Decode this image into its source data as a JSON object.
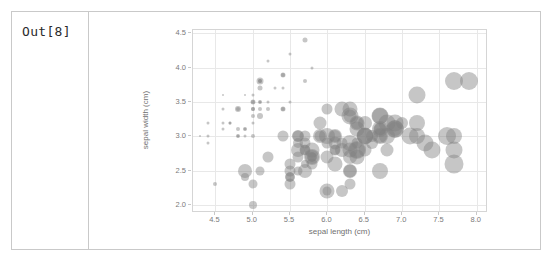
{
  "notebook": {
    "prompt_label": "Out[8]"
  },
  "chart_data": {
    "type": "scatter",
    "title": "",
    "xlabel": "sepal length (cm)",
    "ylabel": "sepal width (cm)",
    "xlim": [
      4.2,
      8.15
    ],
    "ylim": [
      1.88,
      4.55
    ],
    "xticks": [
      4.5,
      5.0,
      5.5,
      6.0,
      6.5,
      7.0,
      7.5,
      8.0
    ],
    "yticks": [
      2.0,
      2.5,
      3.0,
      3.5,
      4.0,
      4.5
    ],
    "xtick_labels": [
      "4.5",
      "5.0",
      "5.5",
      "6.0",
      "6.5",
      "7.0",
      "7.5",
      "8.0"
    ],
    "ytick_labels": [
      "2.0",
      "2.5",
      "3.0",
      "3.5",
      "4.0",
      "4.5"
    ],
    "grid": true,
    "legend": "none",
    "marker_color": "#808080",
    "marker_alpha": 0.45,
    "size_encoding": "petal size (bubble radius)",
    "points": [
      {
        "x": 5.1,
        "y": 3.5,
        "s": 3
      },
      {
        "x": 4.9,
        "y": 3.0,
        "s": 3
      },
      {
        "x": 4.7,
        "y": 3.2,
        "s": 3
      },
      {
        "x": 4.6,
        "y": 3.1,
        "s": 3
      },
      {
        "x": 5.0,
        "y": 3.6,
        "s": 3
      },
      {
        "x": 5.4,
        "y": 3.9,
        "s": 5
      },
      {
        "x": 4.6,
        "y": 3.4,
        "s": 3
      },
      {
        "x": 5.0,
        "y": 3.4,
        "s": 4
      },
      {
        "x": 4.4,
        "y": 2.9,
        "s": 3
      },
      {
        "x": 4.9,
        "y": 3.1,
        "s": 3
      },
      {
        "x": 5.4,
        "y": 3.7,
        "s": 3
      },
      {
        "x": 4.8,
        "y": 3.4,
        "s": 4
      },
      {
        "x": 4.8,
        "y": 3.0,
        "s": 3
      },
      {
        "x": 4.3,
        "y": 3.0,
        "s": 2
      },
      {
        "x": 5.8,
        "y": 4.0,
        "s": 3
      },
      {
        "x": 5.7,
        "y": 4.4,
        "s": 5
      },
      {
        "x": 5.4,
        "y": 3.9,
        "s": 4
      },
      {
        "x": 5.1,
        "y": 3.5,
        "s": 4
      },
      {
        "x": 5.7,
        "y": 3.8,
        "s": 4
      },
      {
        "x": 5.1,
        "y": 3.8,
        "s": 4
      },
      {
        "x": 5.4,
        "y": 3.4,
        "s": 4
      },
      {
        "x": 5.1,
        "y": 3.7,
        "s": 5
      },
      {
        "x": 4.6,
        "y": 3.6,
        "s": 2
      },
      {
        "x": 5.1,
        "y": 3.3,
        "s": 6
      },
      {
        "x": 4.8,
        "y": 3.4,
        "s": 6
      },
      {
        "x": 5.0,
        "y": 3.0,
        "s": 4
      },
      {
        "x": 5.0,
        "y": 3.4,
        "s": 4
      },
      {
        "x": 5.2,
        "y": 3.5,
        "s": 3
      },
      {
        "x": 5.2,
        "y": 3.4,
        "s": 4
      },
      {
        "x": 4.7,
        "y": 3.2,
        "s": 3
      },
      {
        "x": 4.8,
        "y": 3.1,
        "s": 4
      },
      {
        "x": 5.4,
        "y": 3.4,
        "s": 5
      },
      {
        "x": 5.2,
        "y": 4.1,
        "s": 3
      },
      {
        "x": 5.5,
        "y": 4.2,
        "s": 3
      },
      {
        "x": 4.9,
        "y": 3.1,
        "s": 4
      },
      {
        "x": 5.0,
        "y": 3.2,
        "s": 3
      },
      {
        "x": 5.5,
        "y": 3.5,
        "s": 3
      },
      {
        "x": 4.9,
        "y": 3.6,
        "s": 2
      },
      {
        "x": 4.4,
        "y": 3.0,
        "s": 3
      },
      {
        "x": 5.1,
        "y": 3.4,
        "s": 4
      },
      {
        "x": 5.0,
        "y": 3.5,
        "s": 4
      },
      {
        "x": 4.5,
        "y": 2.3,
        "s": 4
      },
      {
        "x": 4.4,
        "y": 3.2,
        "s": 3
      },
      {
        "x": 5.0,
        "y": 3.5,
        "s": 5
      },
      {
        "x": 5.1,
        "y": 3.8,
        "s": 7
      },
      {
        "x": 4.8,
        "y": 3.0,
        "s": 4
      },
      {
        "x": 5.1,
        "y": 3.8,
        "s": 4
      },
      {
        "x": 4.6,
        "y": 3.2,
        "s": 3
      },
      {
        "x": 5.3,
        "y": 3.7,
        "s": 3
      },
      {
        "x": 5.0,
        "y": 3.3,
        "s": 4
      },
      {
        "x": 7.0,
        "y": 3.2,
        "s": 12
      },
      {
        "x": 6.4,
        "y": 3.2,
        "s": 13
      },
      {
        "x": 6.9,
        "y": 3.1,
        "s": 14
      },
      {
        "x": 5.5,
        "y": 2.3,
        "s": 11
      },
      {
        "x": 6.5,
        "y": 2.8,
        "s": 13
      },
      {
        "x": 5.7,
        "y": 2.8,
        "s": 11
      },
      {
        "x": 6.3,
        "y": 3.3,
        "s": 13
      },
      {
        "x": 4.9,
        "y": 2.4,
        "s": 8
      },
      {
        "x": 6.6,
        "y": 2.9,
        "s": 12
      },
      {
        "x": 5.2,
        "y": 2.7,
        "s": 11
      },
      {
        "x": 5.0,
        "y": 2.0,
        "s": 8
      },
      {
        "x": 5.9,
        "y": 3.0,
        "s": 11
      },
      {
        "x": 6.0,
        "y": 2.2,
        "s": 9
      },
      {
        "x": 6.1,
        "y": 2.9,
        "s": 13
      },
      {
        "x": 5.6,
        "y": 2.9,
        "s": 10
      },
      {
        "x": 6.7,
        "y": 3.1,
        "s": 12
      },
      {
        "x": 5.6,
        "y": 3.0,
        "s": 12
      },
      {
        "x": 5.8,
        "y": 2.7,
        "s": 9
      },
      {
        "x": 6.2,
        "y": 2.2,
        "s": 12
      },
      {
        "x": 5.6,
        "y": 2.5,
        "s": 9
      },
      {
        "x": 5.9,
        "y": 3.2,
        "s": 13
      },
      {
        "x": 6.1,
        "y": 2.8,
        "s": 10
      },
      {
        "x": 6.3,
        "y": 2.5,
        "s": 13
      },
      {
        "x": 6.1,
        "y": 2.8,
        "s": 11
      },
      {
        "x": 6.4,
        "y": 2.9,
        "s": 11
      },
      {
        "x": 6.6,
        "y": 3.0,
        "s": 12
      },
      {
        "x": 6.8,
        "y": 2.8,
        "s": 13
      },
      {
        "x": 6.7,
        "y": 3.0,
        "s": 14
      },
      {
        "x": 6.0,
        "y": 2.9,
        "s": 11
      },
      {
        "x": 5.7,
        "y": 2.6,
        "s": 8
      },
      {
        "x": 5.5,
        "y": 2.4,
        "s": 9
      },
      {
        "x": 5.5,
        "y": 2.4,
        "s": 10
      },
      {
        "x": 5.8,
        "y": 2.7,
        "s": 10
      },
      {
        "x": 6.0,
        "y": 2.7,
        "s": 13
      },
      {
        "x": 5.4,
        "y": 3.0,
        "s": 11
      },
      {
        "x": 6.0,
        "y": 3.4,
        "s": 11
      },
      {
        "x": 6.7,
        "y": 3.1,
        "s": 13
      },
      {
        "x": 6.3,
        "y": 2.3,
        "s": 11
      },
      {
        "x": 5.6,
        "y": 3.0,
        "s": 11
      },
      {
        "x": 5.5,
        "y": 2.5,
        "s": 11
      },
      {
        "x": 5.5,
        "y": 2.6,
        "s": 11
      },
      {
        "x": 6.1,
        "y": 3.0,
        "s": 12
      },
      {
        "x": 5.8,
        "y": 2.6,
        "s": 11
      },
      {
        "x": 5.0,
        "y": 2.3,
        "s": 9
      },
      {
        "x": 5.6,
        "y": 2.7,
        "s": 11
      },
      {
        "x": 5.7,
        "y": 3.0,
        "s": 11
      },
      {
        "x": 5.7,
        "y": 2.9,
        "s": 11
      },
      {
        "x": 6.2,
        "y": 2.9,
        "s": 11
      },
      {
        "x": 5.1,
        "y": 2.5,
        "s": 9
      },
      {
        "x": 5.7,
        "y": 2.8,
        "s": 10
      },
      {
        "x": 6.3,
        "y": 3.3,
        "s": 17
      },
      {
        "x": 5.8,
        "y": 2.7,
        "s": 16
      },
      {
        "x": 7.1,
        "y": 3.0,
        "s": 17
      },
      {
        "x": 6.3,
        "y": 2.9,
        "s": 16
      },
      {
        "x": 6.5,
        "y": 3.0,
        "s": 17
      },
      {
        "x": 7.6,
        "y": 3.0,
        "s": 18
      },
      {
        "x": 4.9,
        "y": 2.5,
        "s": 14
      },
      {
        "x": 7.3,
        "y": 2.9,
        "s": 17
      },
      {
        "x": 6.7,
        "y": 2.5,
        "s": 16
      },
      {
        "x": 7.2,
        "y": 3.6,
        "s": 17
      },
      {
        "x": 6.5,
        "y": 3.2,
        "s": 14
      },
      {
        "x": 6.4,
        "y": 2.7,
        "s": 15
      },
      {
        "x": 6.8,
        "y": 3.0,
        "s": 16
      },
      {
        "x": 5.7,
        "y": 2.5,
        "s": 14
      },
      {
        "x": 5.8,
        "y": 2.8,
        "s": 15
      },
      {
        "x": 6.4,
        "y": 3.2,
        "s": 15
      },
      {
        "x": 6.5,
        "y": 3.0,
        "s": 16
      },
      {
        "x": 7.7,
        "y": 3.8,
        "s": 18
      },
      {
        "x": 7.7,
        "y": 2.6,
        "s": 19
      },
      {
        "x": 6.0,
        "y": 2.2,
        "s": 15
      },
      {
        "x": 6.9,
        "y": 3.2,
        "s": 17
      },
      {
        "x": 5.6,
        "y": 2.8,
        "s": 14
      },
      {
        "x": 7.7,
        "y": 2.8,
        "s": 17
      },
      {
        "x": 6.3,
        "y": 2.7,
        "s": 14
      },
      {
        "x": 6.7,
        "y": 3.3,
        "s": 16
      },
      {
        "x": 7.2,
        "y": 3.2,
        "s": 16
      },
      {
        "x": 6.2,
        "y": 2.8,
        "s": 14
      },
      {
        "x": 6.1,
        "y": 3.0,
        "s": 14
      },
      {
        "x": 6.4,
        "y": 2.8,
        "s": 16
      },
      {
        "x": 7.2,
        "y": 3.0,
        "s": 16
      },
      {
        "x": 7.4,
        "y": 2.8,
        "s": 17
      },
      {
        "x": 7.9,
        "y": 3.8,
        "s": 18
      },
      {
        "x": 6.4,
        "y": 2.8,
        "s": 18
      },
      {
        "x": 6.3,
        "y": 2.8,
        "s": 15
      },
      {
        "x": 6.1,
        "y": 2.6,
        "s": 15
      },
      {
        "x": 7.7,
        "y": 3.0,
        "s": 16
      },
      {
        "x": 6.3,
        "y": 3.4,
        "s": 15
      },
      {
        "x": 6.4,
        "y": 3.1,
        "s": 15
      },
      {
        "x": 6.0,
        "y": 3.0,
        "s": 16
      },
      {
        "x": 6.9,
        "y": 3.1,
        "s": 18
      },
      {
        "x": 6.7,
        "y": 3.1,
        "s": 16
      },
      {
        "x": 6.9,
        "y": 3.1,
        "s": 17
      },
      {
        "x": 5.8,
        "y": 2.7,
        "s": 14
      },
      {
        "x": 6.8,
        "y": 3.2,
        "s": 17
      },
      {
        "x": 6.7,
        "y": 3.3,
        "s": 17
      },
      {
        "x": 6.7,
        "y": 3.0,
        "s": 16
      },
      {
        "x": 6.3,
        "y": 2.5,
        "s": 14
      },
      {
        "x": 6.5,
        "y": 3.0,
        "s": 16
      },
      {
        "x": 6.2,
        "y": 3.4,
        "s": 15
      },
      {
        "x": 5.9,
        "y": 3.0,
        "s": 14
      }
    ]
  }
}
